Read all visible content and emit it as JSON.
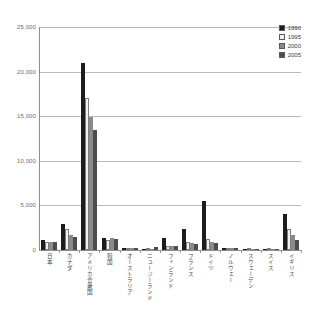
{
  "chart_data": {
    "type": "bar",
    "title": "",
    "xlabel": "",
    "ylabel": "",
    "ylim": [
      0,
      25000
    ],
    "ytick_labels": [
      "25,000",
      "20,000",
      "15,000",
      "10,000",
      "5,000",
      "0"
    ],
    "ytick_values": [
      25000,
      20000,
      15000,
      10000,
      5000,
      0
    ],
    "grid": true,
    "legend_position": "top-right",
    "categories": [
      "日本",
      "カナダ",
      "アメリカ合衆国",
      "韓国",
      "オーストラリア",
      "ニュージーランド",
      "フィンランド",
      "フランス",
      "ドイツ",
      "ノルウェー",
      "スウェーデン",
      "スイス",
      "イギリス"
    ],
    "series": [
      {
        "name": "1990",
        "color": "#1c1c1c",
        "values": [
          1100,
          2900,
          21000,
          1300,
          200,
          120,
          1400,
          2300,
          5500,
          250,
          120,
          150,
          4000
        ]
      },
      {
        "name": "1995",
        "color": "#f2f2f2",
        "values": [
          950,
          2300,
          17000,
          1150,
          150,
          100,
          500,
          900,
          1200,
          180,
          100,
          120,
          2400
        ]
      },
      {
        "name": "2000",
        "color": "#8a8a8a",
        "values": [
          900,
          1700,
          14900,
          1300,
          180,
          130,
          450,
          750,
          900,
          200,
          110,
          130,
          1700
        ]
      },
      {
        "name": "2005",
        "color": "#4d4d4d",
        "values": [
          880,
          1500,
          13400,
          1250,
          200,
          300,
          400,
          700,
          800,
          220,
          150,
          160,
          1100
        ]
      }
    ]
  },
  "legend": {
    "entries": [
      {
        "label": "1990",
        "color": "#1c1c1c"
      },
      {
        "label": "1995",
        "color": "#f2f2f2"
      },
      {
        "label": "2000",
        "color": "#8a8a8a"
      },
      {
        "label": "2005",
        "color": "#4d4d4d"
      }
    ]
  }
}
